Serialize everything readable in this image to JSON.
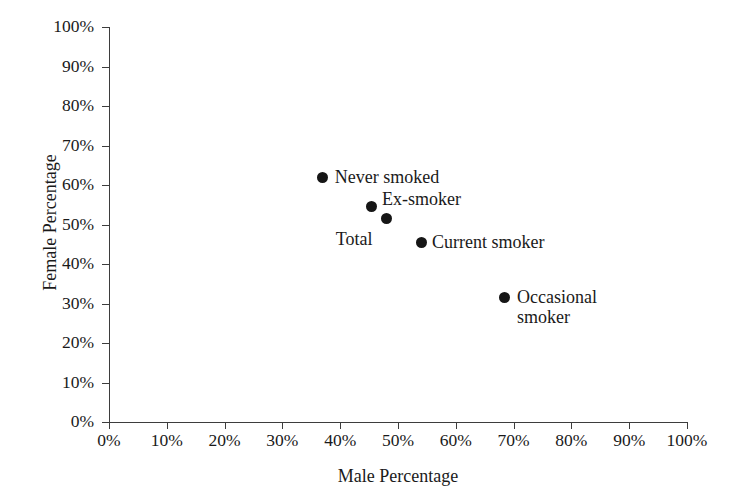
{
  "chart_data": {
    "type": "scatter",
    "title": "",
    "xlabel": "Male Percentage",
    "ylabel": "Female Percentage",
    "xlim": [
      0,
      100
    ],
    "ylim": [
      0,
      100
    ],
    "grid": false,
    "legend": "none (points labelled directly)",
    "x_tick_labels": [
      "0%",
      "10%",
      "20%",
      "30%",
      "40%",
      "50%",
      "60%",
      "70%",
      "80%",
      "90%",
      "100%"
    ],
    "y_tick_labels": [
      "0%",
      "10%",
      "20%",
      "30%",
      "40%",
      "50%",
      "60%",
      "70%",
      "80%",
      "90%",
      "100%"
    ],
    "x_ticks": [
      0,
      10,
      20,
      30,
      40,
      50,
      60,
      70,
      80,
      90,
      100
    ],
    "y_ticks": [
      0,
      10,
      20,
      30,
      40,
      50,
      60,
      70,
      80,
      90,
      100
    ],
    "marker_color": "#161616",
    "axis_color": "#3d3d3d",
    "points": [
      {
        "label": "Never smoked",
        "x": 37,
        "y": 62,
        "label_position": "right",
        "label_dx": 12,
        "label_dy": -10
      },
      {
        "label": "Ex-smoker",
        "x": 45.5,
        "y": 54.5,
        "label_position": "right",
        "label_dx": 10,
        "label_dy": -18
      },
      {
        "label": "Total",
        "x": 48,
        "y": 51.5,
        "label_position": "left",
        "label_dx": -14,
        "label_dy": 10
      },
      {
        "label": "Current smoker",
        "x": 54,
        "y": 45.5,
        "label_position": "right",
        "label_dx": 11,
        "label_dy": -10
      },
      {
        "label": "Occasional\nsmoker",
        "x": 68.5,
        "y": 31.5,
        "label_position": "right",
        "label_dx": 12,
        "label_dy": -11
      }
    ]
  }
}
